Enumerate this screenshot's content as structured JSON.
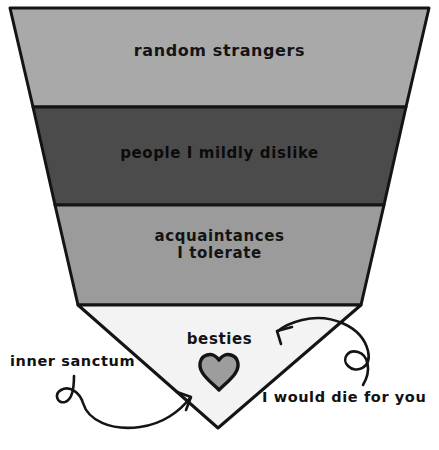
{
  "image": {
    "title": "friendship funnel",
    "background_color": "#ffffff",
    "outline_color": "#141414",
    "width": 439,
    "height": 450
  },
  "funnel": {
    "shape": "inverted-triangle",
    "apex": {
      "x": 218,
      "y": 428
    },
    "top_left": {
      "x": 10,
      "y": 8
    },
    "top_right": {
      "x": 429,
      "y": 8
    },
    "bands": [
      {
        "id": "random-strangers",
        "label": "random  strangers",
        "fill": "#a9a9a9",
        "text_color": "#141414",
        "y_top": 8,
        "y_bottom": 107
      },
      {
        "id": "people-mildly-dislike",
        "label": "people I mildly dislike",
        "fill": "#4b4b4b",
        "text_color": "#0b0b0b",
        "y_top": 107,
        "y_bottom": 205
      },
      {
        "id": "acquaintances-tolerate",
        "label": "acquaintances\nI tolerate",
        "fill": "#9b9b9b",
        "text_color": "#141414",
        "y_top": 205,
        "y_bottom": 305
      },
      {
        "id": "besties",
        "label": "besties",
        "fill": "#f3f3f3",
        "text_color": "#141414",
        "y_top": 305,
        "y_bottom": 428
      }
    ]
  },
  "heart": {
    "icon": "heart-icon",
    "fill": "#9d9d9d",
    "stroke": "#141414",
    "center_x": 219,
    "center_y": 377
  },
  "annotations": [
    {
      "id": "inner-sanctum",
      "label": "inner sanctum",
      "arrow": "curly-loop-arrow-right",
      "points_to": "besties"
    },
    {
      "id": "i-would-die-for-you",
      "label": "I would die for you",
      "arrow": "curly-loop-arrow-left",
      "points_to": "besties"
    }
  ]
}
